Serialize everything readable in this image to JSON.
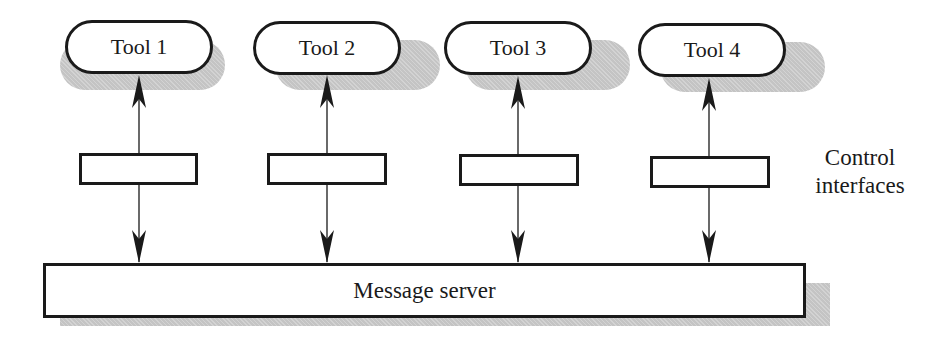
{
  "diagram": {
    "tools": [
      {
        "label": "Tool 1"
      },
      {
        "label": "Tool 2"
      },
      {
        "label": "Tool 3"
      },
      {
        "label": "Tool 4"
      }
    ],
    "interfaces_label_line1": "Control",
    "interfaces_label_line2": "interfaces",
    "server_label": "Message server",
    "colors": {
      "stroke": "#1a1a1a",
      "shadow": "#c4c4c4",
      "background": "#ffffff"
    }
  }
}
